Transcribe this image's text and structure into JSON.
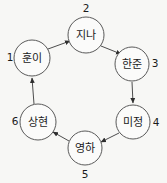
{
  "diagram": {
    "type": "directed-cycle-graph",
    "shape": "hexagon",
    "background_color": "#f7f7f5",
    "node_fill_color": "#fbfbfa",
    "node_stroke_color": "#5a5a5a",
    "edge_color": "#4d4d4d",
    "text_color": "#1a1a1a",
    "nodes": [
      {
        "index": "1",
        "label": "훈이",
        "cx": 32,
        "cy": 58,
        "r": 18,
        "index_x": 10,
        "index_y": 58
      },
      {
        "index": "2",
        "label": "지나",
        "cx": 86,
        "cy": 35,
        "r": 18,
        "index_x": 86,
        "index_y": 9
      },
      {
        "index": "3",
        "label": "한준",
        "cx": 132,
        "cy": 64,
        "r": 17,
        "index_x": 155,
        "index_y": 64
      },
      {
        "index": "4",
        "label": "미정",
        "cx": 133,
        "cy": 122,
        "r": 17,
        "index_x": 156,
        "index_y": 123
      },
      {
        "index": "5",
        "label": "영하",
        "cx": 85,
        "cy": 148,
        "r": 17,
        "index_x": 85,
        "index_y": 175
      },
      {
        "index": "6",
        "label": "상현",
        "cx": 38,
        "cy": 122,
        "r": 18,
        "index_x": 15,
        "index_y": 122
      }
    ],
    "edges": [
      {
        "from": "1",
        "to": "2",
        "x1": 48,
        "y1": 49,
        "x2": 70,
        "y2": 41
      },
      {
        "from": "2",
        "to": "3",
        "x1": 101,
        "y1": 46,
        "x2": 121,
        "y2": 54
      },
      {
        "from": "3",
        "to": "4",
        "x1": 132,
        "y1": 82,
        "x2": 133,
        "y2": 103
      },
      {
        "from": "4",
        "to": "5",
        "x1": 119,
        "y1": 133,
        "x2": 101,
        "y2": 142
      },
      {
        "from": "5",
        "to": "6",
        "x1": 69,
        "y1": 141,
        "x2": 53,
        "y2": 132
      },
      {
        "from": "6",
        "to": "1",
        "x1": 34,
        "y1": 104,
        "x2": 32,
        "y2": 78
      }
    ]
  }
}
